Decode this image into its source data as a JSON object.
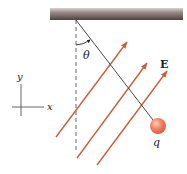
{
  "diagram": {
    "labels": {
      "angle": "θ",
      "field": "E",
      "charge": "q",
      "axis_x": "x",
      "axis_y": "y"
    },
    "colors": {
      "field_arrow": "#c8603c",
      "ceiling_dark": "#5a4a48",
      "ceiling_light": "#b8aeac",
      "string": "#333333",
      "ball": "#f07a5c",
      "ball_highlight": "#ffc8b4",
      "dashed_line": "#555555",
      "axes": "#555555"
    },
    "elements": {
      "ceiling": {
        "x1": 50,
        "x2": 183,
        "y1": 8,
        "y2": 20
      },
      "pivot": {
        "x": 76,
        "y": 20
      },
      "ball": {
        "cx": 158,
        "cy": 126,
        "r": 8
      },
      "field_arrows": [
        {
          "x1": 56,
          "y1": 137,
          "x2": 127,
          "y2": 42
        },
        {
          "x1": 77,
          "y1": 158,
          "x2": 147,
          "y2": 63
        },
        {
          "x1": 97,
          "y1": 165,
          "x2": 167,
          "y2": 71
        }
      ]
    }
  }
}
